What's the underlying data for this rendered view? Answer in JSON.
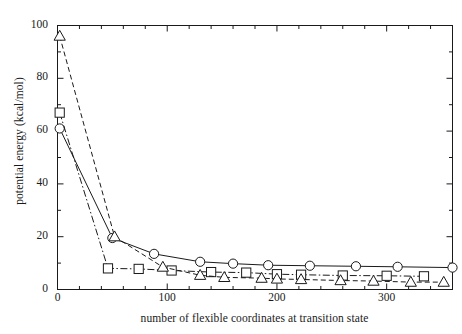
{
  "chart_data": {
    "type": "line",
    "title": "",
    "xlabel": "number of flexible coordinates at transition state",
    "ylabel": "potential energy (kcal/mol)",
    "xlim": [
      0,
      360
    ],
    "ylim": [
      0,
      100
    ],
    "xticks": [
      0,
      100,
      200,
      300
    ],
    "yticks": [
      0,
      20,
      40,
      60,
      80,
      100
    ],
    "xtick_labels": [
      "0",
      "100",
      "200",
      "300"
    ],
    "ytick_labels": [
      "0",
      "20",
      "40",
      "60",
      "80",
      "100"
    ],
    "x_minor_interval": 20,
    "y_minor_interval": 10,
    "grid": false,
    "legend": "none",
    "frame": "box",
    "tick_direction": "in",
    "series": [
      {
        "name": "circle-series",
        "marker": "circle",
        "linestyle": "solid",
        "color": "#1a1a1a",
        "points": [
          {
            "x": 2,
            "y": 61
          },
          {
            "x": 50,
            "y": 19.5
          },
          {
            "x": 88,
            "y": 13.5
          },
          {
            "x": 130,
            "y": 10.5
          },
          {
            "x": 160,
            "y": 9.8
          },
          {
            "x": 192,
            "y": 9.2
          },
          {
            "x": 230,
            "y": 9.0
          },
          {
            "x": 272,
            "y": 8.8
          },
          {
            "x": 310,
            "y": 8.6
          },
          {
            "x": 360,
            "y": 8.3
          }
        ]
      },
      {
        "name": "square-series",
        "marker": "square",
        "linestyle": "dashdot",
        "color": "#1a1a1a",
        "points": [
          {
            "x": 2,
            "y": 67
          },
          {
            "x": 46,
            "y": 8.0
          },
          {
            "x": 74,
            "y": 7.8
          },
          {
            "x": 104,
            "y": 7.2
          },
          {
            "x": 140,
            "y": 6.6
          },
          {
            "x": 172,
            "y": 6.4
          },
          {
            "x": 200,
            "y": 5.8
          },
          {
            "x": 222,
            "y": 5.6
          },
          {
            "x": 260,
            "y": 5.3
          },
          {
            "x": 300,
            "y": 5.2
          },
          {
            "x": 334,
            "y": 5.0
          }
        ]
      },
      {
        "name": "triangle-series",
        "marker": "triangle",
        "linestyle": "dashed",
        "color": "#1a1a1a",
        "points": [
          {
            "x": 2,
            "y": 96
          },
          {
            "x": 52,
            "y": 20.0
          },
          {
            "x": 96,
            "y": 8.5
          },
          {
            "x": 130,
            "y": 5.4
          },
          {
            "x": 152,
            "y": 4.6
          },
          {
            "x": 186,
            "y": 4.3
          },
          {
            "x": 200,
            "y": 4.0
          },
          {
            "x": 222,
            "y": 3.8
          },
          {
            "x": 258,
            "y": 3.4
          },
          {
            "x": 288,
            "y": 3.2
          },
          {
            "x": 322,
            "y": 2.8
          },
          {
            "x": 352,
            "y": 2.8
          }
        ]
      }
    ]
  }
}
